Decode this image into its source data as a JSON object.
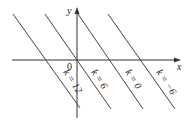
{
  "diagram": {
    "type": "coordinate-plane-parallel-lines",
    "axes": {
      "x_label": "x",
      "y_label": "y",
      "origin_label": "0"
    },
    "lines": [
      {
        "label": "k = 12",
        "x1": 13,
        "y1": 14,
        "x2": 80,
        "y2": 108,
        "label_x": 70,
        "label_y": 84
      },
      {
        "label": "k = 6",
        "x1": 45,
        "y1": 14,
        "x2": 111,
        "y2": 109,
        "label_x": 97,
        "label_y": 82
      },
      {
        "label": "k = 0",
        "x1": 78,
        "y1": 14,
        "x2": 143,
        "y2": 109,
        "label_x": 131,
        "label_y": 82
      },
      {
        "label": "k = −6",
        "x1": 108,
        "y1": 14,
        "x2": 175,
        "y2": 109,
        "label_x": 163,
        "label_y": 84
      }
    ],
    "colors": {
      "line": "#444444",
      "axis": "#333333",
      "background": "#ffffff"
    }
  }
}
